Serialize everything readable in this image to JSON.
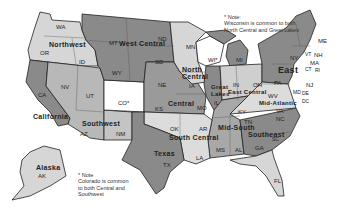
{
  "colors": {
    "light": "#d6d6d6",
    "medium": "#b0b0b0",
    "dark": "#8a8a8a",
    "darker": "#7a7a7a",
    "white": "#ffffff",
    "border": "#222222"
  },
  "regions": [
    {
      "name": "Northwest",
      "states": [
        "WA",
        "OR",
        "ID"
      ]
    },
    {
      "name": "West Central",
      "states": [
        "MT",
        "WY",
        "ND",
        "SD"
      ]
    },
    {
      "name": "North Central",
      "states": [
        "MN",
        "IA",
        "WI"
      ]
    },
    {
      "name": "Great Lakes",
      "states": [
        "MI",
        "IL",
        "WI"
      ]
    },
    {
      "name": "East",
      "states": [
        "NY",
        "PA",
        "NJ",
        "ME",
        "NH",
        "VT",
        "MA",
        "CT",
        "RI"
      ]
    },
    {
      "name": "California",
      "states": [
        "CA"
      ]
    },
    {
      "name": "Southwest",
      "states": [
        "NV",
        "UT",
        "AZ",
        "NM",
        "CO"
      ]
    },
    {
      "name": "Central",
      "states": [
        "NE",
        "KS",
        "MO",
        "CO"
      ]
    },
    {
      "name": "East Central",
      "states": [
        "IN",
        "OH"
      ]
    },
    {
      "name": "Mid-Atlantic",
      "states": [
        "WV",
        "VA",
        "MD",
        "DE",
        "DC"
      ]
    },
    {
      "name": "South Central",
      "states": [
        "OK",
        "AR",
        "LA"
      ]
    },
    {
      "name": "Mid-South",
      "states": [
        "KY",
        "TN",
        "MS",
        "AL"
      ]
    },
    {
      "name": "Southeast",
      "states": [
        "NC",
        "SC",
        "GA",
        "FL"
      ]
    },
    {
      "name": "Texas",
      "states": [
        "TX"
      ]
    },
    {
      "name": "Alaska",
      "states": [
        "AK"
      ]
    }
  ],
  "region_labels": {
    "northwest": "Northwest",
    "west_central": "West Central",
    "north_central_1": "North",
    "north_central_2": "Central",
    "great_lakes_1": "Great",
    "great_lakes_2": "Lakes",
    "east": "East",
    "california": "California",
    "southwest": "Southwest",
    "central": "Central",
    "east_central": "East Central",
    "mid_atlantic": "Mid-Atlantic",
    "south_central": "South Central",
    "mid_south": "Mid-South",
    "southeast": "Southeast",
    "texas": "Texas",
    "alaska": "Alaska"
  },
  "state_labels": {
    "WA": "WA",
    "OR": "OR",
    "ID": "ID",
    "MT": "MT",
    "WY": "WY",
    "ND": "ND",
    "SD": "SD",
    "MN": "MN",
    "WI": "WI*",
    "IA": "IA",
    "MI": "MI",
    "IL": "IL",
    "IN": "IN",
    "OH": "OH",
    "NY": "NY",
    "PA": "PA",
    "ME": "ME",
    "NH": "NH",
    "VT": "VT",
    "MA": "MA",
    "RI": "RI",
    "CT": "CT",
    "NJ": "NJ",
    "DE": "DE",
    "MD": "MD",
    "DC": "DC",
    "CA": "CA",
    "NV": "NV",
    "UT": "UT",
    "CO": "CO*",
    "AZ": "AZ",
    "NM": "NM",
    "NE": "NE",
    "KS": "KS",
    "MO": "MO",
    "OK": "OK",
    "AR": "AR",
    "LA": "LA",
    "TX": "TX",
    "KY": "KY",
    "TN": "TN",
    "WV": "WV",
    "VA": "VA",
    "NC": "NC",
    "SC": "SC",
    "GA": "GA",
    "AL": "AL",
    "MS": "MS",
    "FL": "FL",
    "AK": "AK"
  },
  "notes": {
    "wisconsin": {
      "star": "*",
      "line1": "Note:",
      "line2": "Wisconsin is common to both",
      "line3": "North Central and Great  Lakes"
    },
    "colorado": {
      "star": "*",
      "line1": "Note",
      "line2": "Colorado is common",
      "line3": "to both Central and",
      "line4": "Southwest"
    }
  }
}
